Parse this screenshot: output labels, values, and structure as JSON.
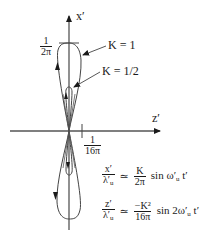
{
  "axes": {
    "vertical_label": "x′",
    "horizontal_label": "z′",
    "vertical_tick": {
      "numerator": "1",
      "denominator": "2π"
    },
    "horizontal_tick": {
      "numerator": "1",
      "denominator": "16π"
    }
  },
  "curves": [
    {
      "label": "K = 1",
      "shape": "figure-eight",
      "half_height_units": "1/2π",
      "half_width_units": "1/16π"
    },
    {
      "label": "K = 1/2",
      "shape": "figure-eight",
      "half_height_units": "1/4π",
      "half_width_units": "1/64π"
    }
  ],
  "equations": [
    {
      "lhs_num": "x′",
      "lhs_den": "λ′",
      "lhs_den_sub": "u",
      "op": "≃",
      "rhs_num": "K",
      "rhs_den": "2π",
      "tail": "sin ω′",
      "tail_sub": "u",
      "tail_end": " t′"
    },
    {
      "lhs_num": "z′",
      "lhs_den": "λ′",
      "lhs_den_sub": "u",
      "op": "≃",
      "rhs_num": "−K²",
      "rhs_den": "16π",
      "tail": "sin 2ω′",
      "tail_sub": "u",
      "tail_end": " t′"
    }
  ],
  "colors": {
    "line": "#1a1a1a",
    "axis": "#555555",
    "curve": "#444444"
  }
}
